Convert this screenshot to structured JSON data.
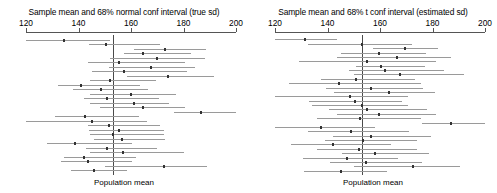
{
  "chart_data": {
    "type": "line",
    "xlabel": "Population mean",
    "ylabel": "",
    "xlim": [
      120,
      200
    ],
    "grid": false,
    "legend": "none",
    "population_mean": 153,
    "tick_labels": [
      "120",
      "140",
      "160",
      "180",
      "200"
    ],
    "ticks": [
      120,
      140,
      160,
      180,
      200
    ],
    "panels": [
      {
        "id": "normal",
        "title": "Sample mean and 68% normal conf interval (true sd)",
        "xlabel": "Population mean",
        "series_name": "68% normal confidence interval",
        "intervals": [
          {
            "mean": 134.5,
            "low": 118.0,
            "high": 152.0
          },
          {
            "mean": 150.5,
            "low": 144.0,
            "high": 171.0
          },
          {
            "mean": 173.0,
            "low": 161.0,
            "high": 188.5
          },
          {
            "mean": 164.5,
            "low": 157.5,
            "high": 183.0
          },
          {
            "mean": 170.0,
            "low": 152.0,
            "high": 188.0
          },
          {
            "mean": 155.5,
            "low": 143.5,
            "high": 180.5
          },
          {
            "mean": 167.5,
            "low": 151.5,
            "high": 184.5
          },
          {
            "mean": 157.5,
            "low": 145.0,
            "high": 181.5
          },
          {
            "mean": 174.0,
            "low": 158.5,
            "high": 191.5
          },
          {
            "mean": 152.0,
            "low": 144.5,
            "high": 169.5
          },
          {
            "mean": 141.0,
            "low": 132.0,
            "high": 163.5
          },
          {
            "mean": 148.5,
            "low": 138.0,
            "high": 166.5
          },
          {
            "mean": 160.0,
            "low": 144.5,
            "high": 177.0
          },
          {
            "mean": 151.0,
            "low": 142.0,
            "high": 170.5
          },
          {
            "mean": 161.0,
            "low": 144.5,
            "high": 174.5
          },
          {
            "mean": 164.5,
            "low": 148.0,
            "high": 180.5
          },
          {
            "mean": 186.5,
            "low": 176.5,
            "high": 200.0
          },
          {
            "mean": 142.5,
            "low": 131.0,
            "high": 163.0
          },
          {
            "mean": 145.0,
            "low": 118.0,
            "high": 166.0
          },
          {
            "mean": 151.5,
            "low": 143.5,
            "high": 171.0
          },
          {
            "mean": 155.5,
            "low": 144.0,
            "high": 172.5
          },
          {
            "mean": 153.0,
            "low": 144.5,
            "high": 172.5
          },
          {
            "mean": 156.5,
            "low": 146.0,
            "high": 173.0
          },
          {
            "mean": 138.5,
            "low": 128.0,
            "high": 160.5
          },
          {
            "mean": 151.0,
            "low": 143.0,
            "high": 170.0
          },
          {
            "mean": 157.0,
            "low": 144.5,
            "high": 180.0
          },
          {
            "mean": 142.0,
            "low": 134.5,
            "high": 162.0
          },
          {
            "mean": 143.5,
            "low": 133.5,
            "high": 160.5
          },
          {
            "mean": 172.5,
            "low": 150.0,
            "high": 189.0
          },
          {
            "mean": 146.0,
            "low": 137.0,
            "high": 158.5
          }
        ]
      },
      {
        "id": "t",
        "title": "Sample mean and 68% t conf interval (estimated sd)",
        "xlabel": "Population mean",
        "series_name": "68% t confidence interval",
        "intervals": [
          {
            "mean": 131.5,
            "low": 120.0,
            "high": 143.5
          },
          {
            "mean": 153.0,
            "low": 132.5,
            "high": 172.0
          },
          {
            "mean": 169.5,
            "low": 157.5,
            "high": 182.0
          },
          {
            "mean": 159.5,
            "low": 145.0,
            "high": 177.5
          },
          {
            "mean": 166.5,
            "low": 143.5,
            "high": 187.0
          },
          {
            "mean": 155.0,
            "low": 129.0,
            "high": 181.5
          },
          {
            "mean": 160.5,
            "low": 151.0,
            "high": 177.0
          },
          {
            "mean": 162.0,
            "low": 148.0,
            "high": 184.5
          },
          {
            "mean": 167.5,
            "low": 150.0,
            "high": 192.0
          },
          {
            "mean": 151.0,
            "low": 137.5,
            "high": 173.5
          },
          {
            "mean": 144.5,
            "low": 125.5,
            "high": 175.5
          },
          {
            "mean": 156.5,
            "low": 139.5,
            "high": 176.5
          },
          {
            "mean": 163.5,
            "low": 142.5,
            "high": 181.0
          },
          {
            "mean": 148.5,
            "low": 118.0,
            "high": 170.5
          },
          {
            "mean": 150.5,
            "low": 133.0,
            "high": 168.5
          },
          {
            "mean": 153.0,
            "low": 134.0,
            "high": 170.5
          },
          {
            "mean": 155.0,
            "low": 140.5,
            "high": 178.0
          },
          {
            "mean": 159.5,
            "low": 143.5,
            "high": 181.5
          },
          {
            "mean": 152.5,
            "low": 136.0,
            "high": 175.5
          },
          {
            "mean": 187.0,
            "low": 176.0,
            "high": 200.0
          },
          {
            "mean": 137.5,
            "low": 120.0,
            "high": 158.0
          },
          {
            "mean": 149.0,
            "low": 132.5,
            "high": 171.0
          },
          {
            "mean": 156.5,
            "low": 142.0,
            "high": 179.5
          },
          {
            "mean": 153.5,
            "low": 139.0,
            "high": 174.0
          },
          {
            "mean": 142.0,
            "low": 126.0,
            "high": 164.0
          },
          {
            "mean": 152.0,
            "low": 136.0,
            "high": 174.0
          },
          {
            "mean": 158.0,
            "low": 145.5,
            "high": 178.5
          },
          {
            "mean": 147.5,
            "low": 130.5,
            "high": 167.0
          },
          {
            "mean": 154.5,
            "low": 141.0,
            "high": 176.0
          },
          {
            "mean": 172.5,
            "low": 150.0,
            "high": 190.5
          },
          {
            "mean": 145.0,
            "low": 131.0,
            "high": 162.5
          }
        ]
      }
    ]
  }
}
